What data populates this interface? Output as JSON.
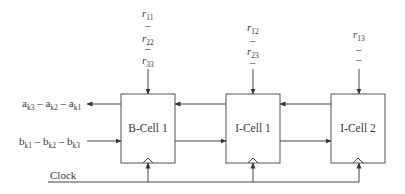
{
  "colors": {
    "line": "#444444",
    "text": "#3a3a3a",
    "background": "#ffffff"
  },
  "inputs_top": {
    "bcell1": [
      {
        "base": "r",
        "sub": "11"
      },
      {
        "sep": "–"
      },
      {
        "base": "r",
        "sub": "22"
      },
      {
        "sep": "–"
      },
      {
        "base": "r",
        "sub": "33"
      }
    ],
    "icell1": [
      {
        "base": "r",
        "sub": "12"
      },
      {
        "sep": "–"
      },
      {
        "base": "r",
        "sub": "23"
      },
      {
        "sep": "–"
      }
    ],
    "icell2": [
      {
        "base": "r",
        "sub": "13"
      },
      {
        "sep": "–"
      },
      {
        "sep": "–"
      }
    ]
  },
  "left_signals": {
    "output_a": {
      "parts": [
        {
          "base": "a",
          "sub": "k3"
        },
        {
          "sep": " – "
        },
        {
          "base": "a",
          "sub": "k2"
        },
        {
          "sep": " – "
        },
        {
          "base": "a",
          "sub": "k1"
        }
      ]
    },
    "input_b": {
      "parts": [
        {
          "base": "b",
          "sub": "k1"
        },
        {
          "sep": " – "
        },
        {
          "base": "b",
          "sub": "k2"
        },
        {
          "sep": " – "
        },
        {
          "base": "b",
          "sub": "k3"
        }
      ]
    }
  },
  "cells": [
    {
      "label": "B-Cell 1"
    },
    {
      "label": "I-Cell 1"
    },
    {
      "label": "I-Cell 2"
    }
  ],
  "clock": {
    "label": "Clock"
  }
}
